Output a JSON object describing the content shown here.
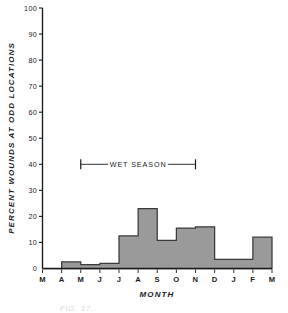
{
  "figure": {
    "caption_partial": "FIG. 17."
  },
  "chart_data": {
    "type": "bar",
    "title": "",
    "xlabel": "MONTH",
    "ylabel": "PERCENT WOUNDS AT ODD LOCATIONS",
    "categories": [
      "M",
      "A",
      "M",
      "J",
      "J",
      "A",
      "S",
      "O",
      "N",
      "D",
      "J",
      "F"
    ],
    "tick_labels_x": [
      "M",
      "A",
      "M",
      "J",
      "J",
      "A",
      "S",
      "O",
      "N",
      "D",
      "J",
      "F",
      "M"
    ],
    "values": [
      0,
      2.5,
      1.5,
      2,
      12.5,
      23,
      10.8,
      15.5,
      16,
      3.5,
      3.5,
      12
    ],
    "tick_labels_y": [
      "0",
      "10",
      "20",
      "30",
      "40",
      "50",
      "60",
      "70",
      "80",
      "90",
      "100"
    ],
    "ylim": [
      0,
      100
    ],
    "ytick_step": 10,
    "grid": false,
    "legend": "none",
    "style": "step-histogram",
    "fill_color": "#9a9a9a",
    "edge_color": "#3a3a3a",
    "axis_color": "#1a1a1a",
    "annotations": [
      {
        "name": "wet-season",
        "label": "WET SEASON",
        "y_value": 40,
        "start_category_index": 2,
        "end_category_index": 8,
        "style": "bracket-with-end-caps"
      }
    ]
  }
}
